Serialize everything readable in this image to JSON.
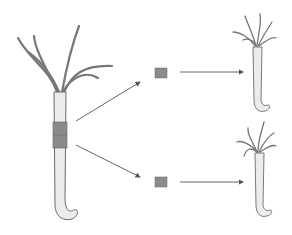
{
  "diagram": {
    "colors": {
      "background": "#ffffff",
      "outline": "#6b6b6b",
      "body_fill": "#ececec",
      "band_fill": "#8a8a8a",
      "fragment_fill": "#8c8c8c",
      "arrow": "#555555"
    },
    "elements": [
      {
        "name": "parent-hydra",
        "note": "cut band in mid-body column"
      },
      {
        "name": "fragment-top",
        "note": "excised tissue piece"
      },
      {
        "name": "fragment-bottom",
        "note": "excised tissue piece"
      },
      {
        "name": "regenerated-hydra-top"
      },
      {
        "name": "regenerated-hydra-bottom"
      }
    ]
  }
}
